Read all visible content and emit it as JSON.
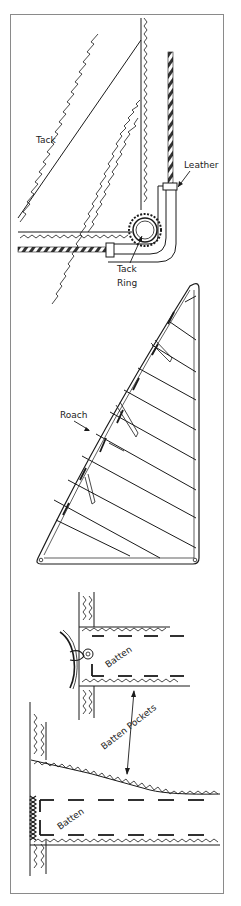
{
  "figure": {
    "panels": [
      {
        "id": "tack-corner",
        "labels": {
          "tack": "Tack",
          "leather": "Leather",
          "tack_ring_line1": "Tack",
          "tack_ring_line2": "Ring"
        }
      },
      {
        "id": "sail-roach",
        "labels": {
          "roach": "Roach"
        }
      },
      {
        "id": "batten-pockets",
        "labels": {
          "batten_upper": "Batten",
          "batten_pockets": "Batten Pockets",
          "batten_lower": "Batten"
        }
      }
    ],
    "colors": {
      "line": "#1a1a1a",
      "frame": "#8a8a8a",
      "background": "#ffffff"
    }
  }
}
